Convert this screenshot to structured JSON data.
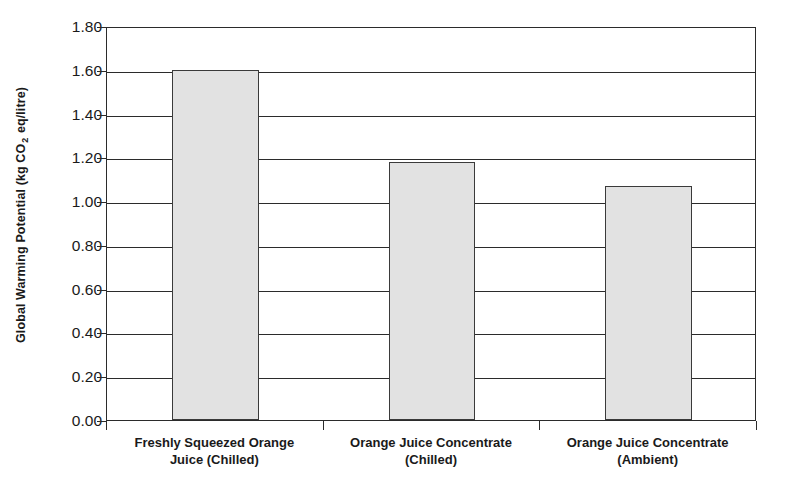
{
  "chart_data": {
    "type": "bar",
    "title": "",
    "subtitle": "",
    "xlabel": "",
    "ylabel": "Global Warming Potential (kg CO 2 eq/litre)",
    "ylabel_parts": {
      "before": "Global Warming Potential (kg CO",
      "subscript": "2",
      "after": " eq/litre)"
    },
    "categories": [
      "Freshly Squeezed Orange Juice (Chilled)",
      "Orange Juice Concentrate (Chilled)",
      "Orange Juice Concentrate (Ambient)"
    ],
    "category_lines": [
      [
        "Freshly Squeezed Orange",
        "Juice (Chilled)"
      ],
      [
        "Orange Juice Concentrate",
        "(Chilled)"
      ],
      [
        "Orange Juice Concentrate",
        "(Ambient)"
      ]
    ],
    "values": [
      1.6,
      1.18,
      1.07
    ],
    "ylim": [
      0.0,
      1.8
    ],
    "ytick_step": 0.2,
    "ytick_labels": [
      "0.00",
      "0.20",
      "0.40",
      "0.60",
      "0.80",
      "1.00",
      "1.20",
      "1.40",
      "1.60",
      "1.80"
    ],
    "ytick_values": [
      0.0,
      0.2,
      0.4,
      0.6,
      0.8,
      1.0,
      1.2,
      1.4,
      1.6,
      1.8
    ],
    "grid": true,
    "grid_axis": "y",
    "legend": false,
    "legend_position": "none",
    "bar_fill_color": "#e2e2e2",
    "bar_edge_color": "#3a3a3a",
    "axis_color": "#2b2b2b",
    "background_color": "#ffffff"
  }
}
